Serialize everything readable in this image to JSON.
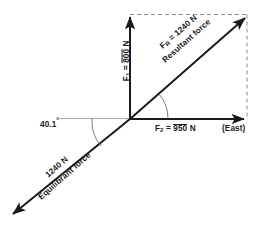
{
  "diagram": {
    "origin": {
      "x": 130,
      "y": 119
    },
    "colors": {
      "stroke": "#1a1a1a",
      "dashed": "#8c8c8c",
      "reference_line": "#a8a8a8",
      "background": "#ffffff"
    },
    "vectors": {
      "f1": {
        "symbol": "F",
        "subscript": "1",
        "magnitude": "800",
        "unit": "N",
        "label": "F₁ = 800 N",
        "direction": "north",
        "tip": {
          "x": 130,
          "y": 15
        }
      },
      "f2": {
        "symbol": "F",
        "subscript": "2",
        "magnitude": "950",
        "unit": "N",
        "label": "F₂ = 950 N",
        "direction": "east",
        "tip": {
          "x": 247,
          "y": 119
        }
      },
      "resultant": {
        "symbol": "F",
        "subscript": "R",
        "magnitude": "1240",
        "unit": "N",
        "label": "F_R = 1240 N",
        "caption": "Resultant force",
        "tip": {
          "x": 247,
          "y": 16
        }
      },
      "equilibrant": {
        "magnitude": "1240",
        "unit": "N",
        "label": "1240 N",
        "caption": "Equilibrant force",
        "tip": {
          "x": 10,
          "y": 217
        }
      }
    },
    "angle": {
      "value": "40.1",
      "unit": "degrees",
      "label": "40.1",
      "degree_symbol": "°"
    },
    "direction_note": "(East)",
    "labels": {
      "f1_prefix": "F",
      "f1_sub": "1",
      "f1_value": "800",
      "f1_unit": "N",
      "f1_eq": "=",
      "f2_prefix": "F",
      "f2_sub": "2",
      "f2_value": "950",
      "f2_unit": "N",
      "f2_eq": "=",
      "fr_prefix": "F",
      "fr_sub": "R",
      "fr_value": "1240",
      "fr_unit": "N",
      "fr_eq": "=",
      "resultant_caption": "Resultant force",
      "equilibrant_value": "1240 N",
      "equilibrant_caption": "Equilibrant force",
      "east": "(East)",
      "angle_value": "40.1",
      "angle_degree": "°"
    }
  }
}
